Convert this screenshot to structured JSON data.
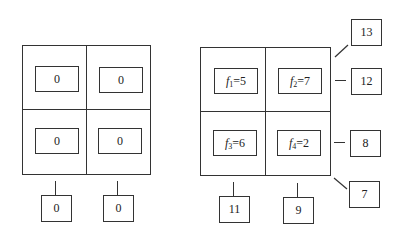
{
  "left_grid": {
    "cells": [
      {
        "value": "0"
      },
      {
        "value": "0"
      },
      {
        "value": "0"
      },
      {
        "value": "0"
      }
    ],
    "column_sums": [
      "0",
      "0"
    ]
  },
  "right_grid": {
    "cells": [
      {
        "var": "f",
        "sub": "1",
        "eq": "=5"
      },
      {
        "var": "f",
        "sub": "2",
        "eq": "=7"
      },
      {
        "var": "f",
        "sub": "3",
        "eq": "=6"
      },
      {
        "var": "f",
        "sub": "4",
        "eq": "=2"
      }
    ],
    "column_sums": [
      "11",
      "9"
    ],
    "row_sums": [
      "12",
      "8"
    ],
    "diagonal_top": "13",
    "diagonal_bottom": "7"
  }
}
